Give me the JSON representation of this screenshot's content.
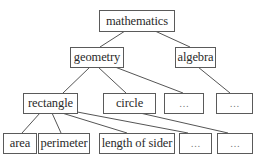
{
  "diagram": {
    "type": "tree",
    "nodes": {
      "mathematics": {
        "label": "mathematics"
      },
      "geometry": {
        "label": "geometry"
      },
      "algebra": {
        "label": "algebra"
      },
      "rectangle": {
        "label": "rectangle"
      },
      "circle": {
        "label": "circle"
      },
      "geometry_more": {
        "label": "…"
      },
      "algebra_more": {
        "label": "…"
      },
      "area": {
        "label": "area"
      },
      "perimeter": {
        "label": "perimeter"
      },
      "length_of_sider": {
        "label": "length of sider"
      },
      "rectangle_more": {
        "label": "…"
      },
      "circle_more": {
        "label": "…"
      }
    },
    "edges": [
      [
        "mathematics",
        "geometry"
      ],
      [
        "mathematics",
        "algebra"
      ],
      [
        "geometry",
        "rectangle"
      ],
      [
        "geometry",
        "circle"
      ],
      [
        "geometry",
        "geometry_more"
      ],
      [
        "algebra",
        "algebra_more"
      ],
      [
        "rectangle",
        "area"
      ],
      [
        "rectangle",
        "perimeter"
      ],
      [
        "rectangle",
        "length_of_sider"
      ],
      [
        "rectangle",
        "rectangle_more"
      ],
      [
        "circle",
        "circle_more"
      ]
    ],
    "colors": {
      "border": "#5a5a5a",
      "line": "#555555",
      "text": "#2a2a2a",
      "background": "#ffffff"
    }
  }
}
